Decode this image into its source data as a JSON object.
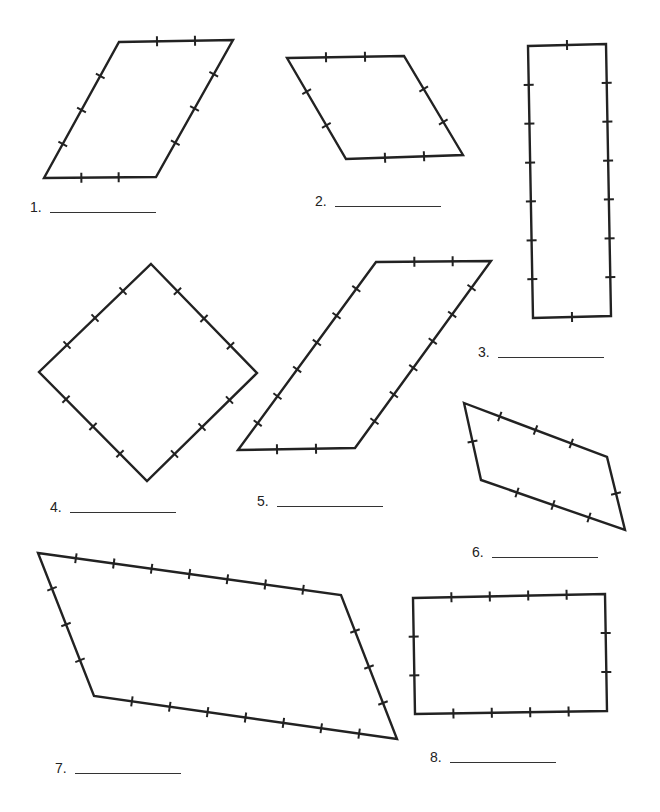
{
  "worksheet": {
    "stroke_color": "#222222",
    "background": "#ffffff",
    "shapes": [
      {
        "id": 1,
        "label": "1.",
        "vertices": [
          [
            119,
            42
          ],
          [
            233,
            40
          ],
          [
            156,
            177
          ],
          [
            44,
            178
          ]
        ],
        "ticks": [
          2,
          3,
          2,
          3
        ],
        "answer_label_pos": [
          30,
          200
        ],
        "blank_width": 106
      },
      {
        "id": 2,
        "label": "2.",
        "vertices": [
          [
            287,
            58
          ],
          [
            404,
            56
          ],
          [
            463,
            155
          ],
          [
            346,
            159
          ]
        ],
        "ticks": [
          2,
          2,
          2,
          2
        ],
        "answer_label_pos": [
          315,
          194
        ],
        "blank_width": 106
      },
      {
        "id": 3,
        "label": "3.",
        "vertices": [
          [
            528,
            46
          ],
          [
            606,
            44
          ],
          [
            611,
            316
          ],
          [
            533,
            318
          ]
        ],
        "ticks": [
          1,
          6,
          1,
          6
        ],
        "answer_label_pos": [
          478,
          345
        ],
        "blank_width": 106
      },
      {
        "id": 4,
        "label": "4.",
        "vertices": [
          [
            151,
            264
          ],
          [
            257,
            373
          ],
          [
            147,
            481
          ],
          [
            39,
            372
          ]
        ],
        "ticks": [
          3,
          3,
          3,
          3
        ],
        "answer_label_pos": [
          50,
          500
        ],
        "blank_width": 106
      },
      {
        "id": 5,
        "label": "5.",
        "vertices": [
          [
            376,
            262
          ],
          [
            491,
            261
          ],
          [
            355,
            448
          ],
          [
            238,
            450
          ]
        ],
        "ticks": [
          2,
          6,
          2,
          6
        ],
        "answer_label_pos": [
          257,
          494
        ],
        "blank_width": 106
      },
      {
        "id": 6,
        "label": "6.",
        "vertices": [
          [
            464,
            403
          ],
          [
            607,
            457
          ],
          [
            625,
            530
          ],
          [
            481,
            480
          ]
        ],
        "ticks": [
          3,
          1,
          3,
          1
        ],
        "answer_label_pos": [
          472,
          545
        ],
        "blank_width": 106
      },
      {
        "id": 7,
        "label": "7.",
        "vertices": [
          [
            38,
            553
          ],
          [
            341,
            595
          ],
          [
            397,
            739
          ],
          [
            94,
            696
          ]
        ],
        "ticks": [
          7,
          3,
          7,
          3
        ],
        "answer_label_pos": [
          55,
          761
        ],
        "blank_width": 106
      },
      {
        "id": 8,
        "label": "8.",
        "vertices": [
          [
            413,
            598
          ],
          [
            605,
            594
          ],
          [
            607,
            711
          ],
          [
            415,
            714
          ]
        ],
        "ticks": [
          4,
          2,
          4,
          2
        ],
        "answer_label_pos": [
          430,
          750
        ],
        "blank_width": 106
      }
    ]
  }
}
